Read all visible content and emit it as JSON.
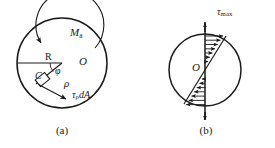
{
  "figure": {
    "stroke_color": "#1a1a1a",
    "background_color": "#ffffff",
    "panels": [
      {
        "id": "a",
        "caption": "(a)",
        "description": "Circular cross-section with applied torque and elemental shear force",
        "circle": {
          "cx": 62,
          "cy": 63,
          "r": 45
        },
        "labels": {
          "moment": "M",
          "moment_sub": "a",
          "radius": "R",
          "point_c": "C",
          "angle": "φ",
          "center": "O",
          "rho": "ρ",
          "shear_force": "τ",
          "shear_force_sub": "ρ",
          "shear_force_tail": "dA"
        }
      },
      {
        "id": "b",
        "caption": "(b)",
        "description": "Linear shear stress distribution across the diameter",
        "circle": {
          "cx": 205,
          "cy": 70,
          "r": 36
        },
        "labels": {
          "center": "O",
          "tau_max": "τ",
          "tau_max_sub": "max"
        }
      }
    ]
  }
}
